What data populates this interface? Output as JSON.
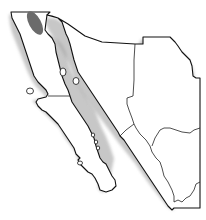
{
  "map": {
    "title": "Range map of northwestern Mexico",
    "region": "Baja California peninsula and northwestern mainland Mexico",
    "colors": {
      "background": "#ffffff",
      "land": "#ffffff",
      "outline": "#111111",
      "range": "#6b6b6b",
      "shadow": "#9a9a9a"
    },
    "range_area": {
      "label": "Distribution range",
      "location": "Northern Baja California"
    },
    "features": [
      {
        "name": "Baja California peninsula"
      },
      {
        "name": "Gulf of California"
      },
      {
        "name": "Sonora"
      },
      {
        "name": "Chihuahua"
      },
      {
        "name": "Sinaloa"
      },
      {
        "name": "Durango"
      },
      {
        "name": "Islands in Gulf of California"
      },
      {
        "name": "Pacific islands"
      }
    ]
  }
}
